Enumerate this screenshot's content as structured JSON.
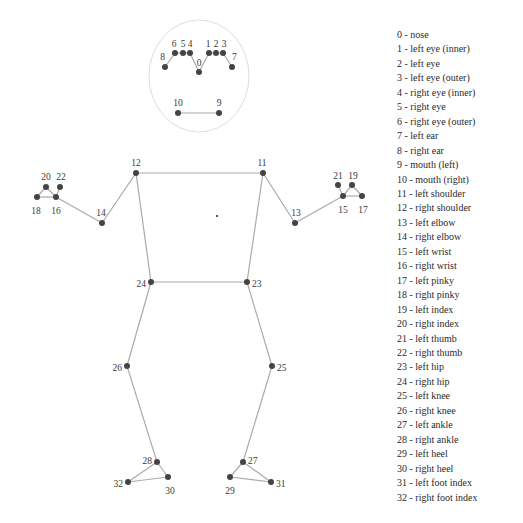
{
  "diagram": {
    "head_ellipse": {
      "cx": 199,
      "cy": 76,
      "rx": 50,
      "ry": 56,
      "color": "#dddddd"
    },
    "line_color": "#aaaaaa",
    "point_color": "#444444",
    "landmarks": [
      {
        "id": 0,
        "name": "nose",
        "x": 199,
        "y": 72,
        "lx": 199,
        "ly": 64,
        "anchor": "middle"
      },
      {
        "id": 1,
        "name": "left eye (inner)",
        "x": 209,
        "y": 53,
        "lx": 208,
        "ly": 45,
        "anchor": "middle"
      },
      {
        "id": 2,
        "name": "left eye",
        "x": 216,
        "y": 53,
        "lx": 216,
        "ly": 45,
        "anchor": "middle"
      },
      {
        "id": 3,
        "name": "left eye (outer)",
        "x": 223,
        "y": 53,
        "lx": 224,
        "ly": 45,
        "anchor": "middle"
      },
      {
        "id": 4,
        "name": "right eye (inner)",
        "x": 190,
        "y": 53,
        "lx": 190,
        "ly": 45,
        "anchor": "middle"
      },
      {
        "id": 5,
        "name": "right eye",
        "x": 183,
        "y": 53,
        "lx": 183,
        "ly": 45,
        "anchor": "middle"
      },
      {
        "id": 6,
        "name": "right eye (outer)",
        "x": 175,
        "y": 53,
        "lx": 174,
        "ly": 45,
        "anchor": "middle"
      },
      {
        "id": 7,
        "name": "left ear",
        "x": 232,
        "y": 67,
        "lx": 232,
        "ly": 58,
        "anchor": "start"
      },
      {
        "id": 8,
        "name": "right ear",
        "x": 165,
        "y": 67,
        "lx": 165,
        "ly": 58,
        "anchor": "end"
      },
      {
        "id": 9,
        "name": "mouth (left)",
        "x": 219,
        "y": 113,
        "lx": 219,
        "ly": 104,
        "anchor": "middle"
      },
      {
        "id": 10,
        "name": "mouth (right)",
        "x": 178,
        "y": 113,
        "lx": 178,
        "ly": 104,
        "anchor": "middle"
      },
      {
        "id": 11,
        "name": "left shoulder",
        "x": 263,
        "y": 173,
        "lx": 262,
        "ly": 164,
        "anchor": "middle"
      },
      {
        "id": 12,
        "name": "right shoulder",
        "x": 136,
        "y": 173,
        "lx": 136,
        "ly": 164,
        "anchor": "middle"
      },
      {
        "id": 13,
        "name": "left elbow",
        "x": 295,
        "y": 223,
        "lx": 296,
        "ly": 214,
        "anchor": "middle"
      },
      {
        "id": 14,
        "name": "right elbow",
        "x": 102,
        "y": 223,
        "lx": 101,
        "ly": 214,
        "anchor": "middle"
      },
      {
        "id": 15,
        "name": "left wrist",
        "x": 343,
        "y": 196,
        "lx": 343,
        "ly": 211,
        "anchor": "middle"
      },
      {
        "id": 16,
        "name": "right wrist",
        "x": 56,
        "y": 197,
        "lx": 56,
        "ly": 212,
        "anchor": "middle"
      },
      {
        "id": 17,
        "name": "left pinky",
        "x": 362,
        "y": 196,
        "lx": 363,
        "ly": 211,
        "anchor": "middle"
      },
      {
        "id": 18,
        "name": "right pinky",
        "x": 37,
        "y": 197,
        "lx": 36,
        "ly": 212,
        "anchor": "middle"
      },
      {
        "id": 19,
        "name": "left index",
        "x": 352,
        "y": 185,
        "lx": 353,
        "ly": 177,
        "anchor": "middle"
      },
      {
        "id": 20,
        "name": "right index",
        "x": 46,
        "y": 187,
        "lx": 46,
        "ly": 178,
        "anchor": "middle"
      },
      {
        "id": 21,
        "name": "left thumb",
        "x": 338,
        "y": 185,
        "lx": 338,
        "ly": 177,
        "anchor": "middle"
      },
      {
        "id": 22,
        "name": "right thumb",
        "x": 60,
        "y": 187,
        "lx": 61,
        "ly": 178,
        "anchor": "middle"
      },
      {
        "id": 23,
        "name": "left hip",
        "x": 247,
        "y": 282,
        "lx": 252,
        "ly": 285,
        "anchor": "start"
      },
      {
        "id": 24,
        "name": "right hip",
        "x": 151,
        "y": 282,
        "lx": 146,
        "ly": 285,
        "anchor": "end"
      },
      {
        "id": 25,
        "name": "left knee",
        "x": 272,
        "y": 366,
        "lx": 277,
        "ly": 369,
        "anchor": "start"
      },
      {
        "id": 26,
        "name": "right knee",
        "x": 127,
        "y": 366,
        "lx": 122,
        "ly": 369,
        "anchor": "end"
      },
      {
        "id": 27,
        "name": "left ankle",
        "x": 243,
        "y": 462,
        "lx": 248,
        "ly": 462,
        "anchor": "start"
      },
      {
        "id": 28,
        "name": "right ankle",
        "x": 157,
        "y": 462,
        "lx": 152,
        "ly": 462,
        "anchor": "end"
      },
      {
        "id": 29,
        "name": "left heel",
        "x": 230,
        "y": 477,
        "lx": 230,
        "ly": 492,
        "anchor": "middle"
      },
      {
        "id": 30,
        "name": "right heel",
        "x": 168,
        "y": 477,
        "lx": 170,
        "ly": 492,
        "anchor": "middle"
      },
      {
        "id": 31,
        "name": "left foot index",
        "x": 271,
        "y": 482,
        "lx": 276,
        "ly": 485,
        "anchor": "start"
      },
      {
        "id": 32,
        "name": "right foot index",
        "x": 128,
        "y": 482,
        "lx": 123,
        "ly": 485,
        "anchor": "end"
      }
    ],
    "connections": [
      [
        0,
        4
      ],
      [
        4,
        5
      ],
      [
        5,
        6
      ],
      [
        6,
        8
      ],
      [
        0,
        1
      ],
      [
        1,
        2
      ],
      [
        2,
        3
      ],
      [
        3,
        7
      ],
      [
        9,
        10
      ],
      [
        11,
        12
      ],
      [
        11,
        23
      ],
      [
        12,
        24
      ],
      [
        23,
        24
      ],
      [
        12,
        14
      ],
      [
        14,
        16
      ],
      [
        16,
        18
      ],
      [
        16,
        20
      ],
      [
        18,
        20
      ],
      [
        16,
        22
      ],
      [
        11,
        13
      ],
      [
        13,
        15
      ],
      [
        15,
        17
      ],
      [
        15,
        19
      ],
      [
        17,
        19
      ],
      [
        15,
        21
      ],
      [
        24,
        26
      ],
      [
        26,
        28
      ],
      [
        28,
        30
      ],
      [
        28,
        32
      ],
      [
        30,
        32
      ],
      [
        23,
        25
      ],
      [
        25,
        27
      ],
      [
        27,
        29
      ],
      [
        27,
        31
      ],
      [
        29,
        31
      ]
    ],
    "stray_dot": {
      "x": 216,
      "y": 215
    }
  },
  "legend": {
    "items": [
      "0 - nose",
      "1 - left eye (inner)",
      "2 - left eye",
      "3 - left eye (outer)",
      "4 - right eye (inner)",
      "5 - right eye",
      "6 - right eye (outer)",
      "7 - left ear",
      "8 - right ear",
      "9 - mouth (left)",
      "10 - mouth (right)",
      "11 - left shoulder",
      "12 - right shoulder",
      "13 - left elbow",
      "14 - right elbow",
      "15 - left wrist",
      "16 - right wrist",
      "17 - left pinky",
      "18 - right pinky",
      "19 - left index",
      "20 - right index",
      "21 - left thumb",
      "22 - right thumb",
      "23 - left hip",
      "24 - right hip",
      "25 - left knee",
      "26 - right knee",
      "27 - left ankle",
      "28 - right ankle",
      "29 - left heel",
      "30 - right heel",
      "31 - left foot index",
      "32 - right foot index"
    ]
  }
}
